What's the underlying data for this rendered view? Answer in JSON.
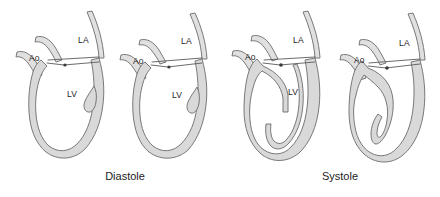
{
  "figure": {
    "background_color": "#ffffff",
    "myocardium_fill": "#d9d9d9",
    "outline_color": "#6b6b6b",
    "label_color": "#1c1c1c"
  },
  "panels": [
    {
      "id": "diastole",
      "caption": "Diastole",
      "caption_x": 125,
      "caption_y": 180,
      "hearts": [
        {
          "id": "diastole-heart-1",
          "labels": [
            {
              "text": "Ao",
              "x": 29,
              "y": 61,
              "name": "label-ao"
            },
            {
              "text": "LA",
              "x": 78,
              "y": 43,
              "name": "label-la"
            },
            {
              "text": "LV",
              "x": 67,
              "y": 97,
              "name": "label-lv"
            }
          ]
        },
        {
          "id": "diastole-heart-2",
          "labels": [
            {
              "text": "Ao",
              "x": 133,
              "y": 64,
              "name": "label-ao"
            },
            {
              "text": "LA",
              "x": 181,
              "y": 44,
              "name": "label-la"
            },
            {
              "text": "LV",
              "x": 172,
              "y": 98,
              "name": "label-lv"
            }
          ]
        }
      ]
    },
    {
      "id": "systole",
      "caption": "Systole",
      "caption_x": 340,
      "caption_y": 180,
      "hearts": [
        {
          "id": "systole-heart-1",
          "labels": [
            {
              "text": "Ao",
              "x": 245,
              "y": 60,
              "name": "label-ao"
            },
            {
              "text": "LA",
              "x": 293,
              "y": 43,
              "name": "label-la"
            },
            {
              "text": "LV",
              "x": 288,
              "y": 95,
              "name": "label-lv"
            }
          ]
        },
        {
          "id": "systole-heart-2",
          "labels": [
            {
              "text": "Ao",
              "x": 354,
              "y": 63,
              "name": "label-ao"
            },
            {
              "text": "LA",
              "x": 399,
              "y": 46,
              "name": "label-la"
            }
          ]
        }
      ]
    }
  ],
  "legend_terms": {
    "ao": "Ao",
    "la": "LA",
    "lv": "LV"
  }
}
